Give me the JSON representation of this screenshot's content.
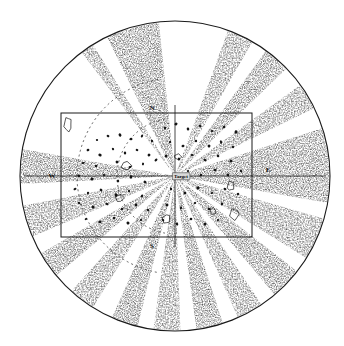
{
  "figure": {
    "background_color": "#ffffff",
    "ink_color": "#1a1a1a",
    "stipple_color": "#555555"
  },
  "center_marker": {
    "label": "Target",
    "x": 178,
    "y": 176
  },
  "axis_labels": {
    "north": "N",
    "east": "E",
    "south": "S",
    "west": "W"
  },
  "axis_label_positions": {
    "north": {
      "x": 152,
      "y": 110
    },
    "east": {
      "x": 268,
      "y": 169
    },
    "south": {
      "x": 152,
      "y": 246
    },
    "west": {
      "x": 52,
      "y": 174
    }
  },
  "boundary_circle": {
    "cx": 175,
    "cy": 176,
    "r": 155,
    "stroke": "#1a1a1a"
  },
  "survey_frame": {
    "x": 61,
    "y": 113,
    "width": 191,
    "height": 124,
    "stroke": "#1a1a1a"
  },
  "chart_data": {
    "type": "scatter",
    "xlabel": "",
    "ylabel": "",
    "grid": false,
    "legend": null,
    "center": {
      "x": 175,
      "y": 176,
      "label": "Target"
    },
    "radius": 155,
    "wedges": [
      {
        "start_deg": 96,
        "end_deg": 116,
        "shade": 0.55
      },
      {
        "start_deg": 122,
        "end_deg": 127,
        "shade": 0.45
      },
      {
        "start_deg": 170,
        "end_deg": 183,
        "shade": 0.55
      },
      {
        "start_deg": 191,
        "end_deg": 203,
        "shade": 0.45
      },
      {
        "start_deg": 210,
        "end_deg": 220,
        "shade": 0.5
      },
      {
        "start_deg": 228,
        "end_deg": 238,
        "shade": 0.5
      },
      {
        "start_deg": 246,
        "end_deg": 256,
        "shade": 0.5
      },
      {
        "start_deg": 262,
        "end_deg": 272,
        "shade": 0.5
      },
      {
        "start_deg": 278,
        "end_deg": 288,
        "shade": 0.5
      },
      {
        "start_deg": 294,
        "end_deg": 304,
        "shade": 0.5
      },
      {
        "start_deg": 310,
        "end_deg": 322,
        "shade": 0.5
      },
      {
        "start_deg": 328,
        "end_deg": 344,
        "shade": 0.5
      },
      {
        "start_deg": 350,
        "end_deg": 18,
        "shade": 0.55
      },
      {
        "start_deg": 26,
        "end_deg": 36,
        "shade": 0.5
      },
      {
        "start_deg": 44,
        "end_deg": 54,
        "shade": 0.5
      },
      {
        "start_deg": 60,
        "end_deg": 70,
        "shade": 0.5
      }
    ],
    "points": [
      {
        "x": 97,
        "y": 140
      },
      {
        "x": 108,
        "y": 136
      },
      {
        "x": 120,
        "y": 135
      },
      {
        "x": 131,
        "y": 139
      },
      {
        "x": 142,
        "y": 136
      },
      {
        "x": 152,
        "y": 141
      },
      {
        "x": 88,
        "y": 150
      },
      {
        "x": 100,
        "y": 155
      },
      {
        "x": 113,
        "y": 149
      },
      {
        "x": 125,
        "y": 153
      },
      {
        "x": 137,
        "y": 150
      },
      {
        "x": 149,
        "y": 155
      },
      {
        "x": 83,
        "y": 163
      },
      {
        "x": 96,
        "y": 166
      },
      {
        "x": 117,
        "y": 162
      },
      {
        "x": 130,
        "y": 167
      },
      {
        "x": 143,
        "y": 164
      },
      {
        "x": 156,
        "y": 160
      },
      {
        "x": 79,
        "y": 176
      },
      {
        "x": 92,
        "y": 179
      },
      {
        "x": 104,
        "y": 175
      },
      {
        "x": 118,
        "y": 181
      },
      {
        "x": 131,
        "y": 177
      },
      {
        "x": 145,
        "y": 182
      },
      {
        "x": 75,
        "y": 189
      },
      {
        "x": 88,
        "y": 193
      },
      {
        "x": 101,
        "y": 190
      },
      {
        "x": 116,
        "y": 195
      },
      {
        "x": 129,
        "y": 191
      },
      {
        "x": 142,
        "y": 196
      },
      {
        "x": 79,
        "y": 203
      },
      {
        "x": 93,
        "y": 207
      },
      {
        "x": 107,
        "y": 204
      },
      {
        "x": 122,
        "y": 209
      },
      {
        "x": 136,
        "y": 205
      },
      {
        "x": 148,
        "y": 210
      },
      {
        "x": 86,
        "y": 219
      },
      {
        "x": 100,
        "y": 222
      },
      {
        "x": 114,
        "y": 218
      },
      {
        "x": 128,
        "y": 223
      },
      {
        "x": 141,
        "y": 220
      },
      {
        "x": 165,
        "y": 128
      },
      {
        "x": 176,
        "y": 124
      },
      {
        "x": 188,
        "y": 129
      },
      {
        "x": 200,
        "y": 126
      },
      {
        "x": 212,
        "y": 131
      },
      {
        "x": 224,
        "y": 127
      },
      {
        "x": 236,
        "y": 132
      },
      {
        "x": 170,
        "y": 142
      },
      {
        "x": 183,
        "y": 146
      },
      {
        "x": 196,
        "y": 141
      },
      {
        "x": 209,
        "y": 146
      },
      {
        "x": 221,
        "y": 142
      },
      {
        "x": 233,
        "y": 147
      },
      {
        "x": 166,
        "y": 156
      },
      {
        "x": 179,
        "y": 159
      },
      {
        "x": 192,
        "y": 155
      },
      {
        "x": 205,
        "y": 160
      },
      {
        "x": 218,
        "y": 156
      },
      {
        "x": 231,
        "y": 161
      },
      {
        "x": 188,
        "y": 171
      },
      {
        "x": 201,
        "y": 175
      },
      {
        "x": 215,
        "y": 170
      },
      {
        "x": 228,
        "y": 175
      },
      {
        "x": 241,
        "y": 171
      },
      {
        "x": 171,
        "y": 189
      },
      {
        "x": 185,
        "y": 193
      },
      {
        "x": 198,
        "y": 188
      },
      {
        "x": 212,
        "y": 193
      },
      {
        "x": 225,
        "y": 189
      },
      {
        "x": 238,
        "y": 194
      },
      {
        "x": 167,
        "y": 205
      },
      {
        "x": 181,
        "y": 208
      },
      {
        "x": 195,
        "y": 203
      },
      {
        "x": 209,
        "y": 209
      },
      {
        "x": 222,
        "y": 204
      },
      {
        "x": 163,
        "y": 220
      },
      {
        "x": 177,
        "y": 224
      },
      {
        "x": 191,
        "y": 219
      },
      {
        "x": 205,
        "y": 224
      },
      {
        "x": 218,
        "y": 220
      }
    ],
    "outlined_blobs": [
      {
        "x": 68,
        "y": 124,
        "rx": 4.0,
        "ry": 7.0
      },
      {
        "x": 126,
        "y": 166,
        "rx": 5.5,
        "ry": 4.0
      },
      {
        "x": 120,
        "y": 198,
        "rx": 4.5,
        "ry": 3.5
      },
      {
        "x": 166,
        "y": 219,
        "rx": 4.0,
        "ry": 4.5
      },
      {
        "x": 231,
        "y": 186,
        "rx": 3.5,
        "ry": 5.0
      },
      {
        "x": 234,
        "y": 214,
        "rx": 4.5,
        "ry": 6.0
      },
      {
        "x": 178,
        "y": 157,
        "rx": 3.5,
        "ry": 3.0
      },
      {
        "x": 213,
        "y": 211,
        "rx": 3.0,
        "ry": 3.5
      }
    ],
    "dashed_arcs": [
      {
        "cx": 175,
        "cy": 176,
        "r": 58,
        "start_deg": 100,
        "end_deg": 260
      },
      {
        "cx": 175,
        "cy": 176,
        "r": 98,
        "start_deg": 100,
        "end_deg": 260
      }
    ],
    "notes": [
      "Stippled wedges radiate outward from the central Target point to the circle boundary.",
      "Inner rectangle marks the surveyed sub-area.",
      "Small filled dots and outlined blobs mark detected objects."
    ]
  }
}
